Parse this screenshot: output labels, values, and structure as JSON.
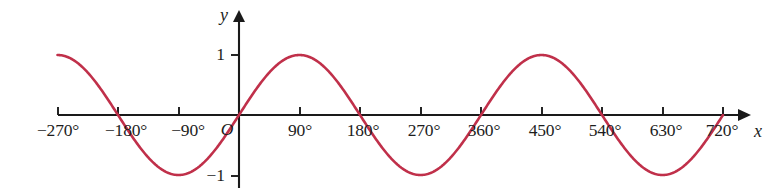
{
  "figure": {
    "background_color": "#ffffff",
    "width": 773,
    "height": 193,
    "axis_color": "#1a1a1a",
    "curve_color": "#c0304a"
  },
  "axes": {
    "x_axis_name": "x",
    "y_axis_name": "y",
    "origin_label": "O"
  },
  "chart_data": {
    "type": "line",
    "title": "",
    "subtitle": "",
    "xlabel": "x",
    "ylabel": "y",
    "xlim": [
      -270,
      720
    ],
    "ylim": [
      -1,
      1
    ],
    "grid": false,
    "legend": false,
    "legend_position": "none",
    "x_tick_labels": [
      "−270°",
      "−180°",
      "−90°",
      "90°",
      "180°",
      "270°",
      "360°",
      "450°",
      "540°",
      "630°",
      "720°"
    ],
    "x_tick_values": [
      -270,
      -180,
      -90,
      90,
      180,
      270,
      360,
      450,
      540,
      630,
      720
    ],
    "y_tick_labels": [
      "1",
      "−1"
    ],
    "y_tick_values": [
      1,
      -1
    ],
    "origin_label": "O",
    "series": [
      {
        "name": "y = sin x",
        "color": "#c0304a",
        "function": "sin",
        "period_degrees": 360,
        "amplitude": 1,
        "phase_degrees": 0,
        "x_start": -270,
        "x_end": 720,
        "x": [
          -270,
          -240,
          -210,
          -180,
          -150,
          -120,
          -90,
          -60,
          -30,
          0,
          30,
          60,
          90,
          120,
          150,
          180,
          210,
          240,
          270,
          300,
          330,
          360,
          390,
          420,
          450,
          480,
          510,
          540,
          570,
          600,
          630,
          660,
          690,
          720
        ],
        "values": [
          1,
          0.87,
          0.5,
          0,
          -0.5,
          -0.87,
          -1,
          -0.87,
          -0.5,
          0,
          0.5,
          0.87,
          1,
          0.87,
          0.5,
          0,
          -0.5,
          -0.87,
          -1,
          -0.87,
          -0.5,
          0,
          0.5,
          0.87,
          1,
          0.87,
          0.5,
          0,
          -0.5,
          -0.87,
          -1,
          -0.87,
          -0.5,
          0
        ],
        "maxima_at": [
          -270,
          90,
          450
        ],
        "minima_at": [
          -90,
          270,
          630
        ],
        "zeros_at": [
          -180,
          0,
          180,
          360,
          540,
          720
        ]
      }
    ]
  }
}
